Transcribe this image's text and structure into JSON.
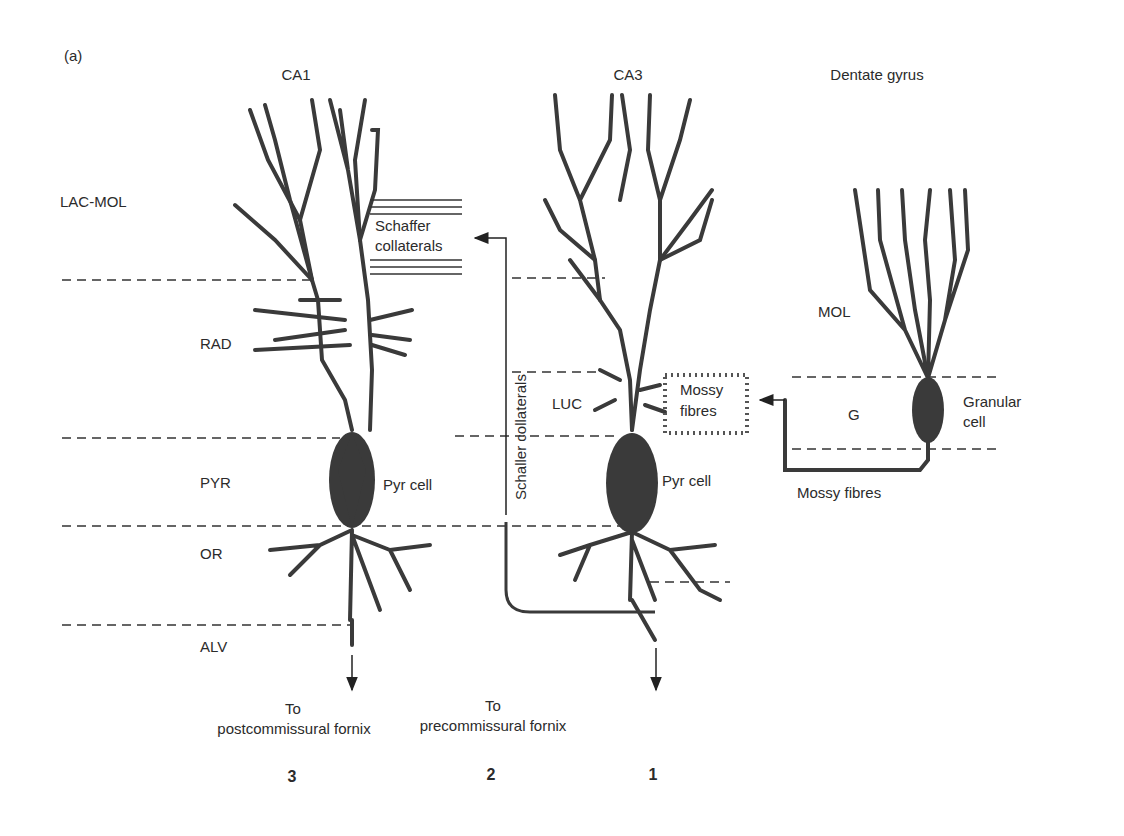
{
  "panel_label": "(a)",
  "regions": {
    "ca1": "CA1",
    "ca3": "CA3",
    "dentate": "Dentate gyrus"
  },
  "layers": {
    "lac_mol": "LAC-MOL",
    "rad": "RAD",
    "pyr": "PYR",
    "or": "OR",
    "alv": "ALV",
    "luc": "LUC",
    "mol": "MOL",
    "g": "G"
  },
  "cells": {
    "ca1_pyr": "Pyr cell",
    "ca3_pyr": "Pyr cell",
    "granular_line1": "Granular",
    "granular_line2": "cell"
  },
  "fibres": {
    "schaffer_box_line1": "Schaffer",
    "schaffer_box_line2": "collaterals",
    "schaffer_vertical": "Schaller collaterals",
    "mossy_box_line1": "Mossy",
    "mossy_box_line2": "fibres",
    "mossy_path": "Mossy fibres"
  },
  "outputs": {
    "ca1_line1": "To",
    "ca1_line2": "postcommissural fornix",
    "ca3_line1": "To",
    "ca3_line2": "precommissural fornix"
  },
  "numbers": {
    "ca1": "3",
    "ca3": "2",
    "dentate": "1"
  },
  "colors": {
    "ink": "#3a3a3a",
    "background": "#ffffff"
  }
}
